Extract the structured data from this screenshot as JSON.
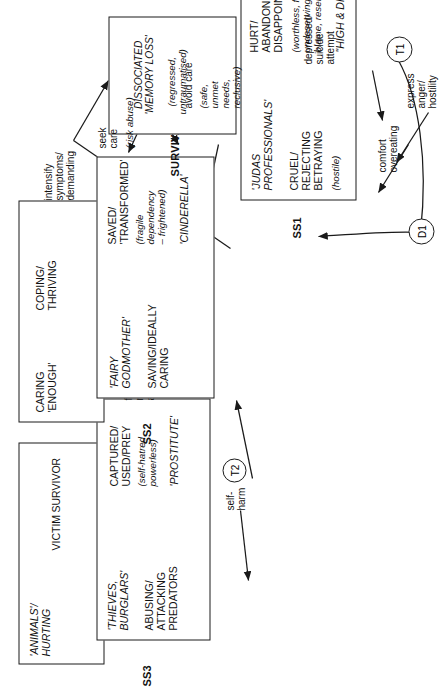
{
  "diagram": {
    "orientation": "rotated-90-ccw",
    "accent": "#1a1a1a"
  },
  "self_states": {
    "ss3": {
      "tag": "SS3",
      "other_top": "'ANIMALS'/\nHURTING",
      "self_top": "VICTIM",
      "self_top2": "SURVIVOR",
      "other_main": "'THIEVES,\nBURGLARS'",
      "other_main_role": "ABUSING/\nATTACKING\nPREDATORS",
      "self_main": "CAPTURED/\nUSED/PREY",
      "self_main_feel": "(self-hatred,\npowerless)",
      "self_main_name": "'PROSTITUTE'"
    },
    "ss2": {
      "tag": "SS2",
      "other_top": "CARING\n'ENOUGH'",
      "self_top": "COPING/\nTHRIVING",
      "other_main": "'FAIRY\nGODMOTHER'",
      "other_main_role": "SAVING/IDEALLY\nCARING",
      "self_main": "SAVED/\n'TRANSFORMED'",
      "self_main_feel": "(fragile\ndependency\n– frightened)",
      "self_main_name": "'CINDERELLA'"
    },
    "ss1": {
      "tag": "SS1",
      "other_main": "'JUDAS\nPROFESSIONALS'",
      "other_main_role": "CRUEL/\nREJECTING\nBETRAYING",
      "other_main_feel": "(hostile)",
      "self_main": "HURT/\nABANDONED\nDISAPPOINTED",
      "self_main_feel": "(worthless, failure,\nundeserving,\nblame, resentful)",
      "self_main_name": "\"HIGH & DRY\""
    }
  },
  "survival": {
    "heading": "SURVIVAL MODE",
    "state": "DISSOCIATED\n'MEMORY LOSS'",
    "qualifier": "(regressed,\nuntraumatised)"
  },
  "procedures": {
    "self_harm": "self-\nharm",
    "flashbacks": "flashbacks\nnightmares\nanxiety",
    "intensify": "intensify\nsymptoms/\ndemanding",
    "seek_care": "seek\ncare",
    "seek_care_note": "(risk abuse)",
    "avoid_care": "avoid care",
    "avoid_care_note": "(safe,\nunmet\nneeds,\nreclusive)",
    "depressed": "depressed/\nsuicide\nattempt",
    "comfort": "comfort\novereating",
    "express_anger": "express\nanger/\nhostility"
  },
  "markers": {
    "t1": "T1",
    "t2": "T2",
    "d1": "D1"
  }
}
